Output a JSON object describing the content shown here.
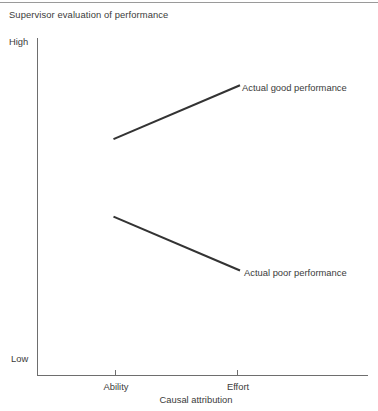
{
  "figure": {
    "title": "Supervisor evaluation of performance",
    "background_color": "#ffffff",
    "axis_color": "#6e6e6e",
    "text_color": "#3b3b3b",
    "line_color": "#333333"
  },
  "chart_data": {
    "type": "line",
    "title": "Supervisor evaluation of performance",
    "xlabel": "Causal attribution",
    "ylabel": "Supervisor evaluation of performance",
    "categories": [
      "Ability",
      "Effort"
    ],
    "x": [
      "Ability",
      "Effort"
    ],
    "xtick_labels": [
      "Ability",
      "Effort"
    ],
    "ytick_labels": [
      "Low",
      "High"
    ],
    "ylim": [
      "Low",
      "High"
    ],
    "grid": false,
    "legend": "inline-annotations",
    "series": [
      {
        "name": "Actual good performance",
        "label": "Actual good performance",
        "values": [
          0.7,
          0.86
        ],
        "points": [
          {
            "x": "Ability",
            "y": 0.7
          },
          {
            "x": "Effort",
            "y": 0.86
          }
        ],
        "color": "#333333"
      },
      {
        "name": "Actual poor performance",
        "label": "Actual poor performance",
        "values": [
          0.47,
          0.31
        ],
        "points": [
          {
            "x": "Ability",
            "y": 0.47
          },
          {
            "x": "Effort",
            "y": 0.31
          }
        ],
        "color": "#333333"
      }
    ],
    "annotations": [
      {
        "text": "Actual good performance",
        "attached_to": "Actual good performance"
      },
      {
        "text": "Actual poor performance",
        "attached_to": "Actual poor performance"
      }
    ]
  },
  "axes": {
    "y": {
      "high_label": "High",
      "low_label": "Low"
    },
    "x": {
      "title": "Causal attribution",
      "ticks": [
        {
          "label": "Ability"
        },
        {
          "label": "Effort"
        }
      ]
    }
  }
}
